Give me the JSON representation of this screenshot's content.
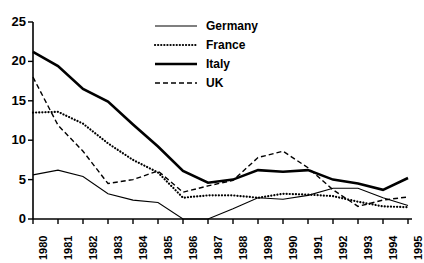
{
  "chart_data": {
    "type": "line",
    "title": "",
    "subtitle": "",
    "xlabel": "",
    "ylabel": "",
    "xlim": [
      1980,
      1995
    ],
    "ylim": [
      0,
      25
    ],
    "grid": false,
    "legend_position": "top-right",
    "x": [
      1980,
      1981,
      1982,
      1983,
      1984,
      1985,
      1986,
      1987,
      1988,
      1989,
      1990,
      1991,
      1992,
      1993,
      1994,
      1995
    ],
    "categories": [
      "1980",
      "1981",
      "1982",
      "1983",
      "1984",
      "1985",
      "1986",
      "1987",
      "1988",
      "1989",
      "1990",
      "1991",
      "1992",
      "1993",
      "1994",
      "1995"
    ],
    "ytick_labels": [
      "0",
      "5",
      "10",
      "15",
      "20",
      "25"
    ],
    "ytick_values": [
      0,
      5,
      10,
      15,
      20,
      25
    ],
    "series": [
      {
        "name": "Germany",
        "style": "solid-thin",
        "color": "#000000",
        "values": [
          5.6,
          6.2,
          5.4,
          3.2,
          2.4,
          2.1,
          0.0,
          0.0,
          1.3,
          2.7,
          2.5,
          3.0,
          3.9,
          3.9,
          2.7,
          1.7
        ]
      },
      {
        "name": "France",
        "style": "dotted",
        "color": "#000000",
        "values": [
          13.5,
          13.6,
          12.1,
          9.6,
          7.5,
          5.9,
          2.7,
          3.0,
          3.0,
          2.7,
          3.2,
          3.1,
          2.9,
          2.2,
          1.6,
          1.5
        ]
      },
      {
        "name": "Italy",
        "style": "solid-thick",
        "color": "#000000",
        "values": [
          21.2,
          19.4,
          16.5,
          14.9,
          12.0,
          9.2,
          6.1,
          4.6,
          5.0,
          6.2,
          6.0,
          6.2,
          5.0,
          4.5,
          3.7,
          5.2
        ]
      },
      {
        "name": "UK",
        "style": "dashed",
        "color": "#000000",
        "values": [
          18.0,
          11.9,
          8.6,
          4.5,
          5.0,
          6.1,
          3.4,
          4.2,
          4.9,
          7.8,
          8.6,
          6.5,
          3.7,
          1.6,
          2.4,
          2.8
        ]
      }
    ]
  },
  "legend": {
    "items": [
      {
        "label": "Germany"
      },
      {
        "label": "France"
      },
      {
        "label": "Italy"
      },
      {
        "label": "UK"
      }
    ]
  }
}
